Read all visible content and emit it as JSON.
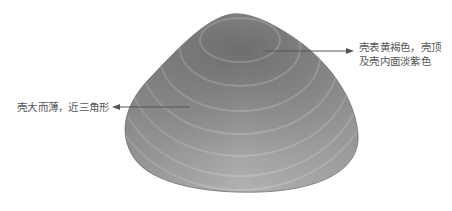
{
  "figure": {
    "annotations": [
      {
        "id": "right",
        "lines": [
          "壳表黄褐色，壳顶",
          "及壳内面淡紫色"
        ]
      },
      {
        "id": "left",
        "lines": [
          "壳大而薄，近三角形"
        ]
      }
    ],
    "colors": {
      "background": "#ffffff",
      "label_text": "#555555",
      "arrow": "#555555",
      "shell_dark": "#6e6e6e",
      "shell_mid": "#9a9a9a",
      "shell_light": "#c4c4c4"
    }
  }
}
